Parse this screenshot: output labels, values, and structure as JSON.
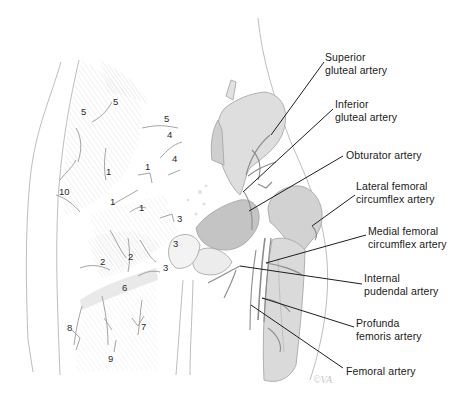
{
  "figure": {
    "signature": "©VA"
  },
  "labels": [
    {
      "id": "superior-gluteal",
      "line1": "Superior",
      "line2": "gluteal artery",
      "x": 325,
      "y": 51,
      "lx1": 324,
      "ly1": 62,
      "lx2": 271,
      "ly2": 135
    },
    {
      "id": "inferior-gluteal",
      "line1": "Inferior",
      "line2": "gluteal artery",
      "x": 335,
      "y": 98,
      "lx1": 333,
      "ly1": 109,
      "lx2": 243,
      "ly2": 192
    },
    {
      "id": "obturator",
      "line1": "Obturator artery",
      "line2": "",
      "x": 346,
      "y": 149,
      "lx1": 343,
      "ly1": 156,
      "lx2": 249,
      "ly2": 211
    },
    {
      "id": "lateral-femoral-circumflex",
      "line1": "Lateral femoral",
      "line2": "circumflex artery",
      "x": 356,
      "y": 180,
      "lx1": 355,
      "ly1": 195,
      "lx2": 312,
      "ly2": 226
    },
    {
      "id": "medial-femoral-circumflex",
      "line1": "Medial femoral",
      "line2": "circumflex artery",
      "x": 368,
      "y": 225,
      "lx1": 366,
      "ly1": 235,
      "lx2": 266,
      "ly2": 263
    },
    {
      "id": "internal-pudendal",
      "line1": "Internal",
      "line2": "pudendal artery",
      "x": 364,
      "y": 272,
      "lx1": 362,
      "ly1": 284,
      "lx2": 240,
      "ly2": 266
    },
    {
      "id": "profunda-femoris",
      "line1": "Profunda",
      "line2": "femoris artery",
      "x": 356,
      "y": 317,
      "lx1": 354,
      "ly1": 327,
      "lx2": 262,
      "ly2": 298
    },
    {
      "id": "femoral",
      "line1": "Femoral artery",
      "line2": "",
      "x": 346,
      "y": 365,
      "lx1": 343,
      "ly1": 368,
      "lx2": 251,
      "ly2": 305
    }
  ],
  "anastomosis_numbers": [
    {
      "n": "5",
      "x": 113,
      "y": 97
    },
    {
      "n": "5",
      "x": 81,
      "y": 107
    },
    {
      "n": "5",
      "x": 164,
      "y": 114
    },
    {
      "n": "4",
      "x": 167,
      "y": 130
    },
    {
      "n": "4",
      "x": 172,
      "y": 154
    },
    {
      "n": "1",
      "x": 106,
      "y": 167
    },
    {
      "n": "1",
      "x": 145,
      "y": 162
    },
    {
      "n": "10",
      "x": 59,
      "y": 187
    },
    {
      "n": "1",
      "x": 110,
      "y": 197
    },
    {
      "n": "1",
      "x": 139,
      "y": 203
    },
    {
      "n": "3",
      "x": 177,
      "y": 214
    },
    {
      "n": "3",
      "x": 173,
      "y": 239
    },
    {
      "n": "2",
      "x": 100,
      "y": 257
    },
    {
      "n": "2",
      "x": 128,
      "y": 252
    },
    {
      "n": "3",
      "x": 163,
      "y": 263
    },
    {
      "n": "6",
      "x": 122,
      "y": 283
    },
    {
      "n": "8",
      "x": 67,
      "y": 323
    },
    {
      "n": "7",
      "x": 141,
      "y": 322
    },
    {
      "n": "9",
      "x": 108,
      "y": 354
    }
  ],
  "colors": {
    "outline": "#b4b4b4",
    "shade": "#c9c9c9",
    "bone": "#d2d2d2",
    "vessel": "#8a8a8a",
    "leader": "#1e1e1e",
    "text": "#1a1a1a"
  }
}
